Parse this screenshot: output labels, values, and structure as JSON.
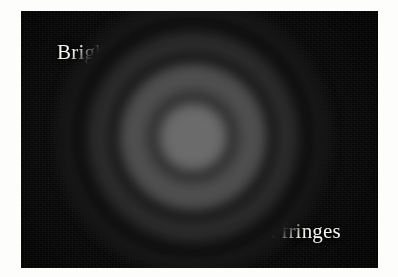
{
  "figure": {
    "kind": "photograph",
    "background_color": "#050505",
    "page_color": "#fdfdfb",
    "annotation_color": "#f6f5f0",
    "photo_bounds": {
      "x": 21,
      "y": 11,
      "width": 357,
      "height": 257
    }
  },
  "annotations": [
    {
      "id": "bright-fringes",
      "label": "Bright fringes",
      "label_x": 57,
      "label_y": 42,
      "leaders": [
        {
          "x1": 127,
          "y1": 67,
          "x2": 181,
          "y2": 98
        },
        {
          "x1": 127,
          "y1": 67,
          "x2": 189,
          "y2": 141
        }
      ]
    },
    {
      "id": "dark-fringes",
      "label": "Dark fringes",
      "label_x": 233,
      "label_y": 221,
      "leaders": [
        {
          "x1": 249,
          "y1": 216,
          "x2": 184,
          "y2": 174
        },
        {
          "x1": 249,
          "y1": 216,
          "x2": 235,
          "y2": 179
        }
      ]
    }
  ],
  "chart_data": {
    "type": "heatmap",
    "xlabel": "",
    "ylabel": "",
    "center": {
      "x": 193,
      "y": 137
    },
    "radial_profile": {
      "radius_px": [
        0,
        12,
        24,
        34,
        40,
        46,
        54,
        62,
        70,
        80,
        90,
        100,
        112,
        124,
        136,
        150,
        165,
        180
      ],
      "intensity": [
        0.42,
        0.42,
        0.41,
        0.38,
        0.1,
        0.22,
        0.3,
        0.33,
        0.26,
        0.09,
        0.13,
        0.17,
        0.12,
        0.06,
        0.08,
        0.05,
        0.03,
        0.02
      ],
      "intensity_range": [
        0,
        1
      ]
    },
    "rings": [
      {
        "name": "central bright disc",
        "type": "bright",
        "inner_radius_px": 0,
        "outer_radius_px": 38,
        "intensity": 0.42
      },
      {
        "name": "first dark fringe",
        "type": "dark",
        "inner_radius_px": 38,
        "outer_radius_px": 46,
        "intensity": 0.1
      },
      {
        "name": "first bright ring",
        "type": "bright",
        "inner_radius_px": 46,
        "outer_radius_px": 78,
        "intensity": 0.31
      },
      {
        "name": "second dark fringe",
        "type": "dark",
        "inner_radius_px": 78,
        "outer_radius_px": 88,
        "intensity": 0.09
      },
      {
        "name": "second bright ring",
        "type": "bright",
        "inner_radius_px": 88,
        "outer_radius_px": 112,
        "intensity": 0.17
      },
      {
        "name": "third dark fringe",
        "type": "dark",
        "inner_radius_px": 112,
        "outer_radius_px": 126,
        "intensity": 0.06
      },
      {
        "name": "third bright ring",
        "type": "bright",
        "inner_radius_px": 126,
        "outer_radius_px": 146,
        "intensity": 0.09
      },
      {
        "name": "outer dark field",
        "type": "dark",
        "inner_radius_px": 146,
        "outer_radius_px": 200,
        "intensity": 0.03
      }
    ],
    "legend": [
      "Bright fringes",
      "Dark fringes"
    ],
    "grid": false
  }
}
